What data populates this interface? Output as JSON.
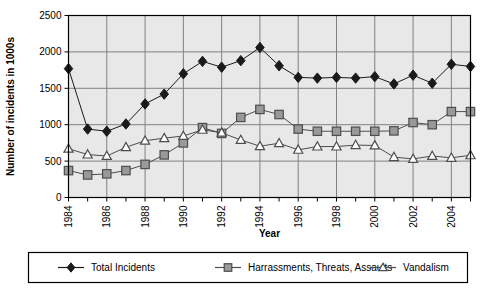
{
  "chart_data": {
    "type": "line",
    "title": "",
    "xlabel": "Year",
    "ylabel": "Number of incidents in 1000s",
    "xlim": [
      1984,
      2005
    ],
    "ylim": [
      0,
      2500
    ],
    "ytick_step": 500,
    "yticks": [
      "0",
      "500",
      "1000",
      "1500",
      "2000",
      "2500"
    ],
    "xticks": [
      "1984",
      "1986",
      "1988",
      "1990",
      "1992",
      "1994",
      "1996",
      "1998",
      "2000",
      "2002",
      "2004"
    ],
    "x": [
      1984,
      1985,
      1986,
      1987,
      1988,
      1989,
      1990,
      1991,
      1992,
      1993,
      1994,
      1995,
      1996,
      1997,
      1998,
      1999,
      2000,
      2001,
      2002,
      2003,
      2004,
      2005
    ],
    "grid": true,
    "grid_color": "#808080",
    "plot_background": "#e8e8e8",
    "legend_position": "bottom",
    "series": [
      {
        "name": "Total Incidents",
        "marker": "diamond",
        "color": "#1a1a1a",
        "fill": "#1a1a1a",
        "values": [
          1770,
          940,
          910,
          1010,
          1285,
          1420,
          1700,
          1870,
          1790,
          1880,
          2060,
          1810,
          1650,
          1640,
          1650,
          1640,
          1660,
          1560,
          1680,
          1570,
          1830,
          1800
        ]
      },
      {
        "name": "Harrassments, Threats, Assaults",
        "marker": "square",
        "color": "#4d4d4d",
        "fill": "#999999",
        "values": [
          370,
          310,
          325,
          370,
          455,
          585,
          750,
          960,
          880,
          1100,
          1210,
          1140,
          940,
          910,
          910,
          910,
          910,
          915,
          1030,
          1000,
          1180,
          1180
        ]
      },
      {
        "name": "Vandalism",
        "marker": "triangle",
        "color": "#4d4d4d",
        "fill": "#ffffff",
        "values": [
          670,
          590,
          570,
          690,
          780,
          815,
          845,
          930,
          890,
          790,
          705,
          745,
          655,
          700,
          700,
          720,
          715,
          555,
          530,
          570,
          545,
          580
        ]
      }
    ]
  },
  "legend": {
    "items": [
      {
        "label": "Total Incidents",
        "marker": "diamond"
      },
      {
        "label": "Harrassments, Threats, Assaults",
        "marker": "square"
      },
      {
        "label": "Vandalism",
        "marker": "triangle"
      }
    ]
  }
}
